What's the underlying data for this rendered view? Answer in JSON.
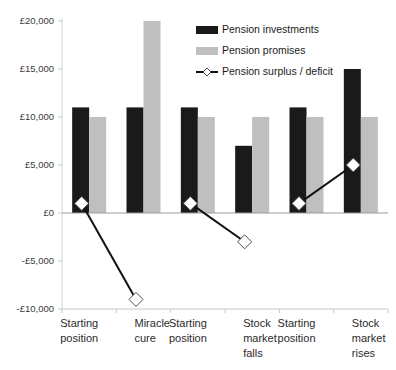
{
  "chart_data": {
    "type": "bar",
    "title": "",
    "subtitle": "",
    "xlabel": "",
    "ylabel": "",
    "ylim": [
      -10000,
      20000
    ],
    "ytick_values": [
      20000,
      15000,
      10000,
      5000,
      0,
      -5000,
      -10000
    ],
    "ytick_labels": [
      "£20,000",
      "£15,000",
      "£10,000",
      "£5,000",
      "£0",
      "-£5,000",
      "-£10,000"
    ],
    "grid": false,
    "legend_position": "top-center",
    "currency_symbol": "£",
    "groups": [
      {
        "name": "scenario-miracle-cure",
        "categories": [
          "Starting position",
          "Miracle cure"
        ],
        "category_lines": [
          [
            "Starting",
            "position"
          ],
          [
            "Miracle",
            "cure"
          ]
        ]
      },
      {
        "name": "scenario-stock-market-falls",
        "categories": [
          "Starting position",
          "Stock market falls"
        ],
        "category_lines": [
          [
            "Starting",
            "position"
          ],
          [
            "Stock",
            "market",
            "falls"
          ]
        ]
      },
      {
        "name": "scenario-stock-market-rises",
        "categories": [
          "Starting position",
          "Stock market rises"
        ],
        "category_lines": [
          [
            "Starting",
            "position"
          ],
          [
            "Stock",
            "market",
            "rises"
          ]
        ]
      }
    ],
    "categories": [
      "Starting position",
      "Miracle cure",
      "Starting position",
      "Stock market falls",
      "Starting position",
      "Stock market rises"
    ],
    "series": [
      {
        "name": "Pension investments",
        "type": "bar",
        "color": "#1a1a1a",
        "values": [
          11000,
          11000,
          11000,
          7000,
          11000,
          15000
        ]
      },
      {
        "name": "Pension promises",
        "type": "bar",
        "color": "#bfbfbf",
        "values": [
          10000,
          20000,
          10000,
          10000,
          10000,
          10000
        ]
      },
      {
        "name": "Pension surplus / deficit",
        "type": "line",
        "color": "#111111",
        "marker": "diamond",
        "marker_fill": "#ffffff",
        "values": [
          1000,
          -9000,
          1000,
          -3000,
          1000,
          5000
        ],
        "segments": [
          [
            0,
            1
          ],
          [
            2,
            3
          ],
          [
            4,
            5
          ]
        ]
      }
    ]
  },
  "legend": {
    "items": [
      {
        "label": "Pension investments",
        "marker": "bar-swatch",
        "color": "#1a1a1a"
      },
      {
        "label": "Pension promises",
        "marker": "bar-swatch",
        "color": "#bfbfbf"
      },
      {
        "label": "Pension surplus / deficit",
        "marker": "line-diamond",
        "color": "#111111"
      }
    ]
  }
}
